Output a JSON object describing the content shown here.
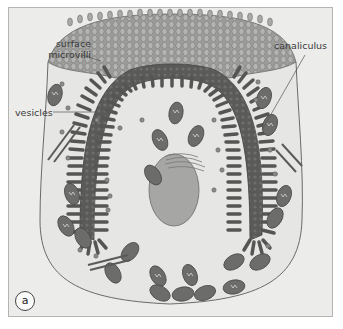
{
  "figure": {
    "panel_label": "a",
    "labels": {
      "surface_microvilli": "surface microvilli",
      "surface_line1": "surface",
      "surface_line2": "microvilli",
      "vesicles": "vesicles",
      "canaliculus": "canaliculus"
    },
    "structures": [
      "cell membrane",
      "surface microvilli",
      "canaliculus",
      "mitochondria",
      "vesicles",
      "Golgi apparatus",
      "nucleus",
      "tubulovesicles"
    ],
    "colors": {
      "background": "#ececea",
      "cytoplasm": "#e4e4e2",
      "microvilli_dark": "#555555",
      "microvilli_mid": "#8a8a88",
      "surface_microvilli": "#a8a8a6",
      "mitochondria": "#6a6a68",
      "nucleus": "#a4a4a2",
      "outline": "#666666"
    }
  }
}
